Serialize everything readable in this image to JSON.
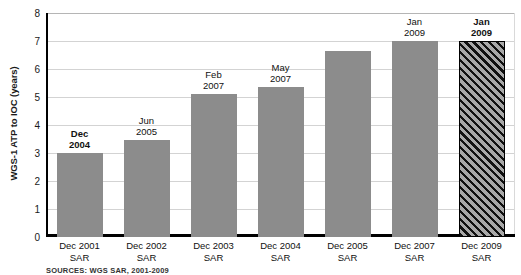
{
  "chart_data": {
    "type": "bar",
    "title": "",
    "xlabel": "",
    "ylabel": "WGS-1 ATP to IOC (years)",
    "ylim": [
      0,
      8
    ],
    "yticks": [
      "0",
      "1",
      "2",
      "3",
      "4",
      "5",
      "6",
      "7",
      "8"
    ],
    "grid": true,
    "legend": "none",
    "categories": [
      "Dec 2001\nSAR",
      "Dec 2002\nSAR",
      "Dec 2003\nSAR",
      "Dec 2004\nSAR",
      "Dec 2005\nSAR",
      "Dec 2007\nSAR",
      "Dec 2009\nSAR"
    ],
    "values": [
      3.0,
      3.45,
      5.1,
      5.35,
      6.65,
      7.0,
      7.0
    ],
    "point_labels": [
      "Dec\n2004",
      "Jun\n2005",
      "Feb\n2007",
      "May\n2007",
      "",
      "Jan\n2009",
      "Jan\n2009"
    ],
    "point_label_bold": [
      true,
      false,
      false,
      false,
      false,
      false,
      true
    ],
    "bar_styles": [
      "solid",
      "solid",
      "solid",
      "solid",
      "solid",
      "solid",
      "hatched"
    ],
    "colors": {
      "bar_fill": "#8c8c8c",
      "hatch_fill": "#a8a8a8",
      "hatch_line": "#111111",
      "gridline": "#d3d3d3",
      "axis": "#000000",
      "text": "#111111"
    }
  },
  "source_note": "SOURCES: WGS SAR, 2001-2009"
}
